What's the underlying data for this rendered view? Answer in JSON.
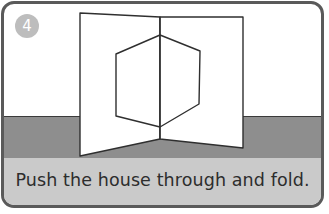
{
  "step": {
    "number": "4",
    "instruction": "Push the house through and fold."
  },
  "colors": {
    "border": "#5a5a5a",
    "floor": "#8e8e8e",
    "caption_band": "#cacaca",
    "badge": "#bdbdbd",
    "line": "#2f2f2f"
  },
  "illustration": {
    "description": "folded card with hexagonal house outline pushed through the fold",
    "left_panel": [
      [
        80,
        13
      ],
      [
        160,
        17
      ],
      [
        160,
        139
      ],
      [
        80,
        156
      ]
    ],
    "right_panel": [
      [
        160,
        17
      ],
      [
        243,
        17
      ],
      [
        243,
        148
      ],
      [
        160,
        139
      ]
    ],
    "hexagon": [
      [
        160,
        35
      ],
      [
        116,
        54
      ],
      [
        116,
        116
      ],
      [
        160,
        127
      ],
      [
        199,
        104
      ],
      [
        200,
        51
      ]
    ]
  }
}
